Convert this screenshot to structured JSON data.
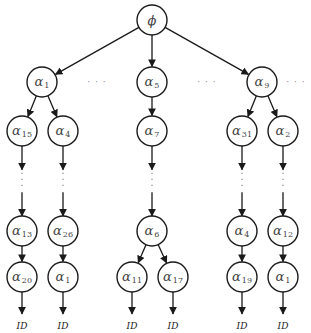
{
  "diagram": {
    "root": {
      "id": "root",
      "label": "ϕ",
      "x": 152,
      "y": 20
    },
    "nodes": [
      {
        "id": "n_a1",
        "sym": "α",
        "sub": "1",
        "x": 42,
        "y": 82
      },
      {
        "id": "n_a5",
        "sym": "α",
        "sub": "5",
        "x": 152,
        "y": 82
      },
      {
        "id": "n_a9",
        "sym": "α",
        "sub": "9",
        "x": 262,
        "y": 82
      },
      {
        "id": "n_a15",
        "sym": "α",
        "sub": "15",
        "x": 22,
        "y": 131
      },
      {
        "id": "n_a4a",
        "sym": "α",
        "sub": "4",
        "x": 63,
        "y": 131
      },
      {
        "id": "n_a7",
        "sym": "α",
        "sub": "7",
        "x": 152,
        "y": 131
      },
      {
        "id": "n_a31",
        "sym": "α",
        "sub": "31",
        "x": 242,
        "y": 131
      },
      {
        "id": "n_a2",
        "sym": "α",
        "sub": "2",
        "x": 283,
        "y": 131
      },
      {
        "id": "n_a13",
        "sym": "α",
        "sub": "13",
        "x": 22,
        "y": 231
      },
      {
        "id": "n_a26",
        "sym": "α",
        "sub": "26",
        "x": 63,
        "y": 231
      },
      {
        "id": "n_a6",
        "sym": "α",
        "sub": "6",
        "x": 152,
        "y": 231
      },
      {
        "id": "n_a4b",
        "sym": "α",
        "sub": "4",
        "x": 242,
        "y": 231
      },
      {
        "id": "n_a12",
        "sym": "α",
        "sub": "12",
        "x": 283,
        "y": 231
      },
      {
        "id": "n_a20",
        "sym": "α",
        "sub": "20",
        "x": 22,
        "y": 277
      },
      {
        "id": "n_a1b",
        "sym": "α",
        "sub": "1",
        "x": 63,
        "y": 277
      },
      {
        "id": "n_a11",
        "sym": "α",
        "sub": "11",
        "x": 132,
        "y": 277
      },
      {
        "id": "n_a17",
        "sym": "α",
        "sub": "17",
        "x": 173,
        "y": 277
      },
      {
        "id": "n_a19",
        "sym": "α",
        "sub": "19",
        "x": 242,
        "y": 277
      },
      {
        "id": "n_a1c",
        "sym": "α",
        "sub": "1",
        "x": 283,
        "y": 277
      }
    ],
    "edges": [
      [
        "root",
        "n_a1"
      ],
      [
        "root",
        "n_a5"
      ],
      [
        "root",
        "n_a9"
      ],
      [
        "n_a1",
        "n_a15"
      ],
      [
        "n_a1",
        "n_a4a"
      ],
      [
        "n_a5",
        "n_a7"
      ],
      [
        "n_a9",
        "n_a31"
      ],
      [
        "n_a9",
        "n_a2"
      ],
      [
        "n_a13",
        "n_a20"
      ],
      [
        "n_a26",
        "n_a1b"
      ],
      [
        "n_a6",
        "n_a11"
      ],
      [
        "n_a6",
        "n_a17"
      ],
      [
        "n_a4b",
        "n_a19"
      ],
      [
        "n_a12",
        "n_a1c"
      ]
    ],
    "elided_paths": [
      [
        "n_a15",
        "n_a13"
      ],
      [
        "n_a4a",
        "n_a26"
      ],
      [
        "n_a7",
        "n_a6"
      ],
      [
        "n_a31",
        "n_a4b"
      ],
      [
        "n_a2",
        "n_a12"
      ]
    ],
    "leaf_outputs": [
      {
        "from": "n_a20",
        "label": "ID"
      },
      {
        "from": "n_a1b",
        "label": "ID"
      },
      {
        "from": "n_a11",
        "label": "ID"
      },
      {
        "from": "n_a17",
        "label": "ID"
      },
      {
        "from": "n_a19",
        "label": "ID"
      },
      {
        "from": "n_a1c",
        "label": "ID"
      }
    ],
    "sibling_ellipses": [
      {
        "label": "· · ·",
        "x": 97,
        "y": 82
      },
      {
        "label": "· · ·",
        "x": 207,
        "y": 82
      },
      {
        "label": "· · ·",
        "x": 296,
        "y": 82
      }
    ],
    "node_radius": 15
  }
}
